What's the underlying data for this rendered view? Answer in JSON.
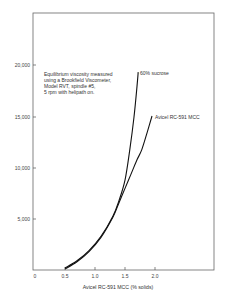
{
  "chart_data": {
    "type": "line",
    "title": "",
    "xlabel": "Avicel RC-591 MCC (% solids)",
    "ylabel": "",
    "xlim": [
      0,
      2.5
    ],
    "ylim": [
      0,
      24000
    ],
    "x_ticks": [
      "0",
      "0.5",
      "1.0",
      "1.5",
      "2.0"
    ],
    "y_ticks": [
      "5,000",
      "10,000",
      "15,000",
      "20,000"
    ],
    "grid": false,
    "legend": "inline labels at curve ends",
    "annotation": {
      "lines": [
        "Equilibrium viscosity measured",
        "using a Brookfield Viscometer,",
        "Model RVT, spindle #5,",
        "5 rpm with helipath on."
      ]
    },
    "series": [
      {
        "name": "60% sucrose",
        "x": [
          0.5,
          0.7,
          0.9,
          1.1,
          1.3,
          1.4,
          1.5,
          1.58,
          1.65,
          1.7,
          1.72
        ],
        "y": [
          200,
          900,
          1900,
          3300,
          5300,
          6800,
          8800,
          11800,
          15000,
          18000,
          19400
        ]
      },
      {
        "name": "Avicel RC-591 MCC",
        "x": [
          0.5,
          0.7,
          0.9,
          1.1,
          1.3,
          1.4,
          1.5,
          1.6,
          1.7,
          1.78,
          1.87,
          1.95
        ],
        "y": [
          100,
          800,
          1800,
          3200,
          5200,
          6600,
          8000,
          9400,
          10800,
          11800,
          13500,
          15100
        ]
      }
    ]
  },
  "labels": {
    "series_0": "60% sucrose",
    "series_1": "Avicel RC-591 MCC",
    "xlabel": "Avicel RC-591 MCC (% solids)",
    "annot_0": "Equilibrium viscosity measured",
    "annot_1": "using a Brookfield Viscometer,",
    "annot_2": "Model RVT, spindle #5,",
    "annot_3": "5 rpm with helipath on.",
    "xt_0": "0",
    "xt_1": "0.5",
    "xt_2": "1.0",
    "xt_3": "1.5",
    "xt_4": "2.0",
    "yt_0": "5,000",
    "yt_1": "10,000",
    "yt_2": "15,000",
    "yt_3": "20,000"
  }
}
